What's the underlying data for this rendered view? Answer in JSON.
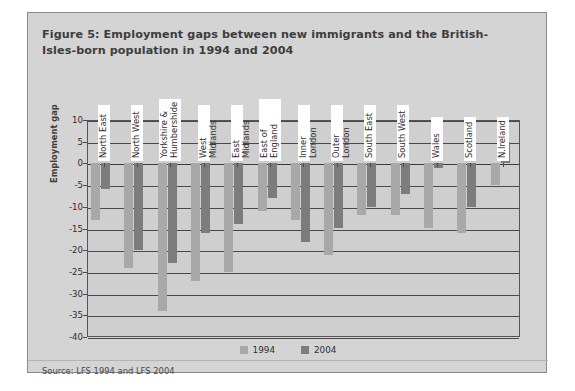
{
  "figure": {
    "title": "Figure 5: Employment gaps between new immigrants and the British-Isles-born population in 1994 and 2004",
    "source": "Source: LFS 1994 and LFS 2004",
    "background_color": "#d4d4d4",
    "plot_background_color": "#cfcfcf"
  },
  "chart_data": {
    "type": "bar",
    "title": "Figure 5: Employment gaps between new immigrants and the British-Isles-born population in 1994 and 2004",
    "xlabel": "",
    "ylabel": "Employment gap",
    "ylim": [
      -40,
      10
    ],
    "ytick_step": 5,
    "yticks": [
      "10",
      "5",
      "0",
      "-5",
      "-10",
      "-15",
      "-20",
      "-25",
      "-30",
      "-35",
      "-40"
    ],
    "grid": true,
    "legend_position": "bottom",
    "categories": [
      "North East",
      "North West",
      "Yorkshire &\nHumbershide",
      "West Midlands",
      "East Midlands",
      "East of\nEngland",
      "Inner London",
      "Outer London",
      "South East",
      "South West",
      "Wales",
      "Scotland",
      "N.Ireland"
    ],
    "series": [
      {
        "name": "1994",
        "color": "#a8a8a8",
        "values": [
          -13,
          -24,
          -34,
          -27,
          -25,
          -11,
          -13,
          -21,
          -12,
          -12,
          -15,
          -16,
          -5
        ]
      },
      {
        "name": "2004",
        "color": "#7c7c7c",
        "values": [
          -6,
          -20,
          -23,
          -16,
          -14,
          -8,
          -18,
          -15,
          -10,
          -7,
          -1,
          -10,
          5
        ]
      }
    ]
  },
  "legend": {
    "items": [
      {
        "label": "1994",
        "color": "#a8a8a8"
      },
      {
        "label": "2004",
        "color": "#7c7c7c"
      }
    ]
  }
}
